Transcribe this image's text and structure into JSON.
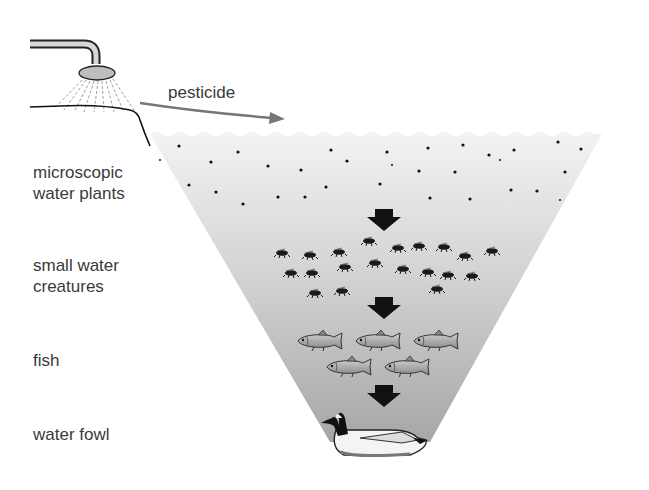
{
  "diagram": {
    "source_label": "pesticide",
    "levels": [
      {
        "id": "plants",
        "lines": [
          "microscopic",
          "water plants"
        ]
      },
      {
        "id": "creatures",
        "lines": [
          "small water",
          "creatures"
        ]
      },
      {
        "id": "fish",
        "lines": [
          "fish"
        ]
      },
      {
        "id": "fowl",
        "lines": [
          "water fowl"
        ]
      }
    ],
    "icons": {
      "sprayer": "shower-head-sprayer-icon",
      "flow_arrow": "curved-arrow-icon",
      "down_arrow": "down-arrow-icon",
      "plankton": "dot-icon",
      "insect": "water-insect-icon",
      "fish": "trout-icon",
      "bird": "goose-icon"
    },
    "colors": {
      "funnel_top": "#f2f2f2",
      "funnel_bottom": "#a8a8a8",
      "arrow": "#111111",
      "text": "#3a3a3a",
      "curve_arrow": "#707070"
    },
    "counts": {
      "plankton_dots": 32,
      "insects": 20,
      "fish": 5,
      "birds": 1
    }
  }
}
